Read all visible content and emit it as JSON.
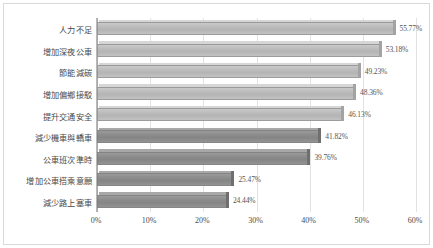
{
  "chart_data": {
    "type": "bar",
    "orientation": "horizontal",
    "title": "",
    "subtitle": "",
    "xlabel": "",
    "ylabel": "",
    "xlim": [
      0,
      60
    ],
    "grid": true,
    "legend": "none",
    "categories": [
      "人力不足",
      "增加深夜公車",
      "節能減碳",
      "增加偏鄉接駁",
      "提升交通安全",
      "減少機車與轎車",
      "公車班次準時",
      "增加公車搭乘意願",
      "減少路上塞車"
    ],
    "values": [
      55.77,
      53.18,
      49.23,
      48.36,
      46.13,
      41.82,
      39.76,
      25.47,
      24.44
    ],
    "value_labels": [
      "55.77%",
      "53.18%",
      "49.23%",
      "48.36%",
      "46.13%",
      "41.82%",
      "39.76%",
      "25.47%",
      "24.44%"
    ],
    "bar_shades": [
      "light",
      "light",
      "light",
      "light",
      "light",
      "dark",
      "dark",
      "dark",
      "dark"
    ],
    "xticks": [
      0,
      10,
      20,
      30,
      40,
      50,
      60
    ],
    "xtick_labels": [
      "0%",
      "10%",
      "20%",
      "30%",
      "40%",
      "50%",
      "60%"
    ],
    "colors": {
      "bar_light": "#bcbcbc",
      "bar_dark": "#8c8c8c",
      "gridline": "#e2e2e2",
      "axis": "#a8a8a8",
      "text": "#4a4a4a",
      "value_text": "#555555",
      "background": "#ffffff",
      "frame": "#d9d9d9"
    }
  }
}
